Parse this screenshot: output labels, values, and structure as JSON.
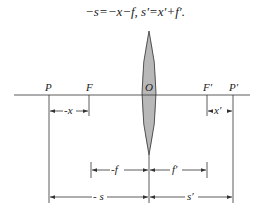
{
  "formula": "−s=−x−f, s′=x′+f′.",
  "labels": {
    "P": "P",
    "F": "F",
    "O": "O",
    "F_prime": "F′",
    "P_prime": "P′"
  },
  "dimensions": {
    "x": "-x",
    "x_prime": "x′",
    "f": "-f",
    "f_prime": "f′",
    "s": "- s",
    "s_prime": "s′"
  },
  "colors": {
    "lens_fill": "#b8b8b8",
    "line": "#333333"
  }
}
